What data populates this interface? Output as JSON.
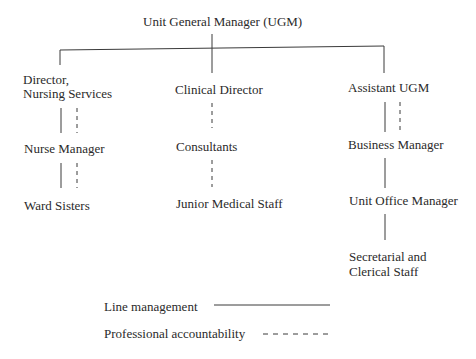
{
  "title": "Unit General Manager (UGM)",
  "branches": [
    {
      "head": [
        "Director,",
        "Nursing Services"
      ],
      "levels": [
        "Nurse Manager",
        "Ward Sisters"
      ]
    },
    {
      "head": [
        "Clinical Director"
      ],
      "levels": [
        "Consultants",
        "Junior Medical Staff"
      ]
    },
    {
      "head": [
        "Assistant UGM"
      ],
      "levels": [
        "Business Manager",
        "Unit Office Manager",
        "Secretarial and",
        "Clerical Staff"
      ]
    }
  ],
  "legend": {
    "line_management": "Line management",
    "professional_accountability": "Professional accountability"
  },
  "colors": {
    "line": "#3a3a3a",
    "text": "#2a2a2a"
  }
}
